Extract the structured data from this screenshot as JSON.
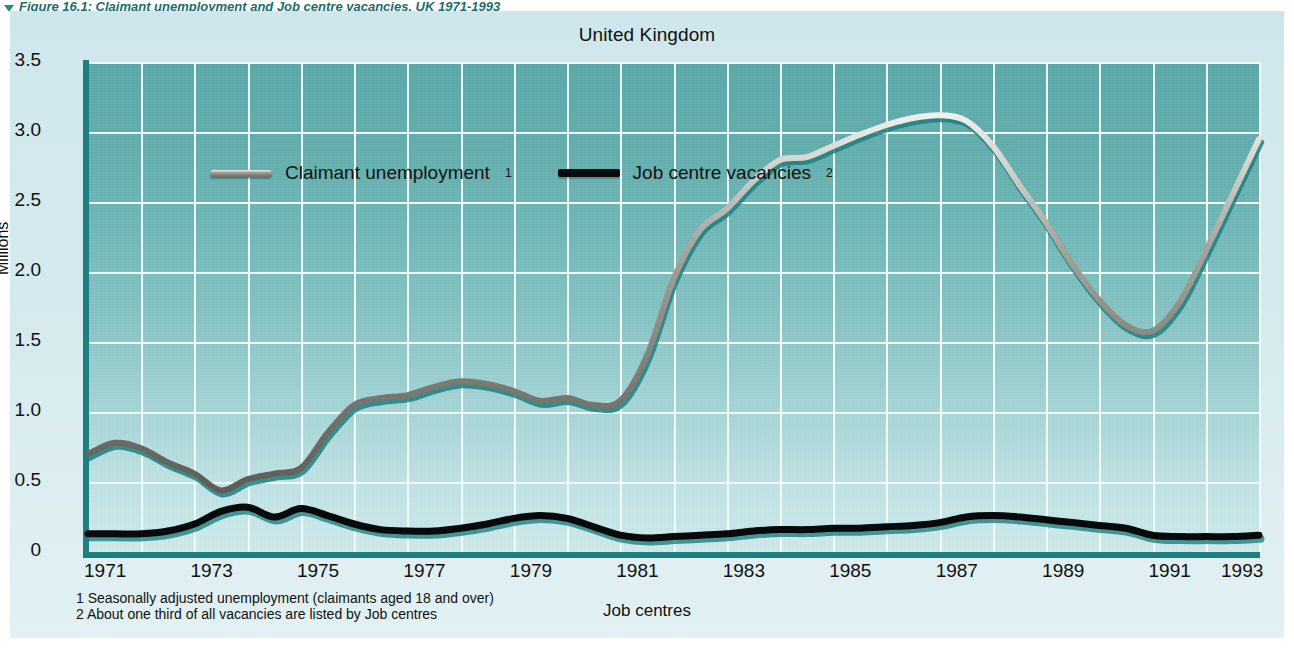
{
  "figure": {
    "caption": "Figure 16.1: Claimant unemployment and Job centre vacancies, UK 1971-1993",
    "marker_icon": "triangle-down-icon"
  },
  "chart_title": "United Kingdom",
  "y_axis_title": "Millions",
  "x_axis_title": "Job centres",
  "legend": {
    "items": [
      {
        "label": "Claimant unemployment",
        "note": "1",
        "color": "#8d8d86",
        "style": "silver-line"
      },
      {
        "label": "Job centre vacancies",
        "note": "2",
        "color": "#08090a",
        "style": "black-line"
      }
    ]
  },
  "footnotes": [
    "1 Seasonally adjusted unemployment (claimants aged 18 and over)",
    "2 About one third of all vacancies are listed by Job centres"
  ],
  "colors": {
    "plot_top": "#5aa8a8",
    "plot_bottom": "#cfeaec",
    "panel": "#d5eaee",
    "grid": "#f2fbfb",
    "axis": "#1c7e80",
    "caption": "#1a6e6e",
    "unemployment_line": "#8d8d86",
    "vacancies_line": "#08090a"
  },
  "chart_data": {
    "type": "line",
    "title": "United Kingdom",
    "subtitle": "Claimant unemployment and Job centre vacancies, UK 1971-1993",
    "xlabel": "Job centres",
    "ylabel": "Millions",
    "xlim": [
      1971,
      1993
    ],
    "ylim": [
      0,
      3.5
    ],
    "yticks": [
      0,
      0.5,
      1.0,
      1.5,
      2.0,
      2.5,
      3.0,
      3.5
    ],
    "ytick_labels": [
      "0",
      "0.5",
      "1.0",
      "1.5",
      "2.0",
      "2.5",
      "3.0",
      "3.5"
    ],
    "xticks": [
      1971,
      1973,
      1975,
      1977,
      1979,
      1981,
      1983,
      1985,
      1987,
      1989,
      1991,
      1993
    ],
    "xtick_labels": [
      "1971",
      "1973",
      "1975",
      "1977",
      "1979",
      "1981",
      "1983",
      "1985",
      "1987",
      "1989",
      "1991",
      "1993"
    ],
    "grid": true,
    "grid_x_step": 1,
    "grid_y_step": 0.5,
    "legend_position": "top-left inside plot",
    "x": [
      1971.0,
      1971.5,
      1972.0,
      1972.5,
      1973.0,
      1973.5,
      1974.0,
      1974.5,
      1975.0,
      1975.5,
      1976.0,
      1976.5,
      1977.0,
      1977.5,
      1978.0,
      1978.5,
      1979.0,
      1979.5,
      1980.0,
      1980.5,
      1981.0,
      1981.5,
      1982.0,
      1982.5,
      1983.0,
      1983.5,
      1984.0,
      1984.5,
      1985.0,
      1985.5,
      1986.0,
      1986.5,
      1987.0,
      1987.5,
      1988.0,
      1988.5,
      1989.0,
      1989.5,
      1990.0,
      1990.5,
      1991.0,
      1991.5,
      1992.0,
      1992.5,
      1993.0
    ],
    "series": [
      {
        "name": "Claimant unemployment",
        "note": "Seasonally adjusted unemployment (claimants aged 18 and over)",
        "units": "millions",
        "color": "#8d8d86",
        "values": [
          0.7,
          0.78,
          0.74,
          0.64,
          0.56,
          0.44,
          0.52,
          0.56,
          0.6,
          0.85,
          1.05,
          1.1,
          1.12,
          1.18,
          1.22,
          1.2,
          1.15,
          1.08,
          1.1,
          1.05,
          1.08,
          1.4,
          1.95,
          2.3,
          2.45,
          2.65,
          2.8,
          2.82,
          2.9,
          2.98,
          3.05,
          3.1,
          3.12,
          3.08,
          2.9,
          2.62,
          2.35,
          2.05,
          1.8,
          1.62,
          1.58,
          1.78,
          2.15,
          2.55,
          2.95
        ]
      },
      {
        "name": "Job centre vacancies",
        "note": "About one third of all vacancies are listed by Job centres",
        "units": "millions",
        "color": "#08090a",
        "values": [
          0.13,
          0.13,
          0.13,
          0.15,
          0.2,
          0.29,
          0.32,
          0.25,
          0.31,
          0.26,
          0.2,
          0.16,
          0.15,
          0.15,
          0.17,
          0.2,
          0.24,
          0.26,
          0.24,
          0.18,
          0.12,
          0.1,
          0.11,
          0.12,
          0.13,
          0.15,
          0.16,
          0.16,
          0.17,
          0.17,
          0.18,
          0.19,
          0.21,
          0.25,
          0.26,
          0.25,
          0.23,
          0.21,
          0.19,
          0.17,
          0.12,
          0.11,
          0.11,
          0.11,
          0.12
        ]
      }
    ],
    "annotations": [
      {
        "text": "Unemployment peaks at about 3.12m in 1987",
        "x": 1987.0,
        "y": 3.12
      },
      {
        "text": "Unemployment trough about 0.44m in 1973.5",
        "x": 1973.5,
        "y": 0.44
      },
      {
        "text": "Vacancies peak about 0.32m in 1974",
        "x": 1974.0,
        "y": 0.32
      }
    ]
  }
}
